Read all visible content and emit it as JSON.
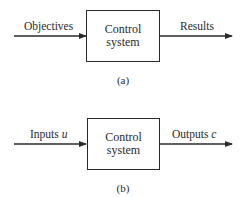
{
  "diagrams": [
    {
      "id": "a",
      "input_label": "Objectives",
      "input_var": "",
      "box_line1": "Control",
      "box_line2": "system",
      "output_label": "Results",
      "output_var": "",
      "caption": "(a)"
    },
    {
      "id": "b",
      "input_label": "Inputs ",
      "input_var": "u",
      "box_line1": "Control",
      "box_line2": "system",
      "output_label": "Outputs ",
      "output_var": "c",
      "caption": "(b)"
    }
  ],
  "colors": {
    "ink": "#2a2a2a",
    "background": "#ffffff"
  }
}
